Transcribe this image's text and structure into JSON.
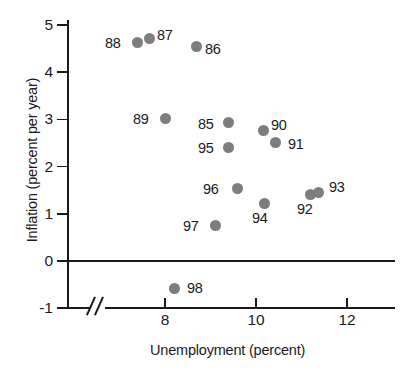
{
  "chart_data": {
    "type": "scatter",
    "title": "",
    "xlabel": "Unemployment (percent)",
    "ylabel": "Inflation (percent per year)",
    "xlim": [
      6.9,
      13.0
    ],
    "ylim": [
      -1,
      5.3
    ],
    "xticks": [
      8,
      10,
      12
    ],
    "yticks": [
      5,
      4,
      3,
      2,
      1,
      0,
      -1
    ],
    "xtick_labels": [
      "8",
      "10",
      "12"
    ],
    "ytick_labels": [
      "5",
      "4",
      "3",
      "2",
      "1",
      "0",
      "-1"
    ],
    "grid": false,
    "legend": null,
    "axis_break_x": true,
    "zero_reference_line": true,
    "point_color": "#7d7d7d",
    "axis_color": "#1a1a1a",
    "points": [
      {
        "label": "85",
        "x": 9.4,
        "y": 2.93,
        "lx": 198,
        "ly": 117
      },
      {
        "label": "86",
        "x": 8.7,
        "y": 4.55,
        "lx": 205,
        "ly": 42
      },
      {
        "label": "87",
        "x": 7.67,
        "y": 4.72,
        "lx": 157,
        "ly": 28
      },
      {
        "label": "88",
        "x": 7.4,
        "y": 4.62,
        "lx": 105,
        "ly": 36
      },
      {
        "label": "89",
        "x": 8.02,
        "y": 3.02,
        "lx": 133,
        "ly": 112
      },
      {
        "label": "90",
        "x": 10.16,
        "y": 2.77,
        "lx": 271,
        "ly": 118
      },
      {
        "label": "91",
        "x": 10.42,
        "y": 2.52,
        "lx": 288,
        "ly": 137
      },
      {
        "label": "92",
        "x": 11.19,
        "y": 1.41,
        "lx": 297,
        "ly": 202
      },
      {
        "label": "93",
        "x": 11.38,
        "y": 1.46,
        "lx": 329,
        "ly": 180
      },
      {
        "label": "94",
        "x": 10.19,
        "y": 1.21,
        "lx": 252,
        "ly": 211
      },
      {
        "label": "95",
        "x": 9.4,
        "y": 2.41,
        "lx": 198,
        "ly": 141
      },
      {
        "label": "96",
        "x": 9.59,
        "y": 1.53,
        "lx": 203,
        "ly": 182
      },
      {
        "label": "97",
        "x": 9.12,
        "y": 0.75,
        "lx": 183,
        "ly": 219
      },
      {
        "label": "98",
        "x": 8.2,
        "y": -0.59,
        "lx": 187,
        "ly": 281
      }
    ]
  },
  "axes": {
    "y_title": "Inflation (percent per year)",
    "x_title": "Unemployment (percent)"
  }
}
